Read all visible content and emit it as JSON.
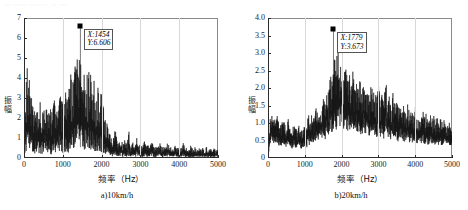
{
  "cutoff_text": "▫▫▫ ▫▫▫▫▫ ▫▫▫▫ ▫▫ ▫▫ ▫▫▫",
  "figures": [
    {
      "id": "figure-a",
      "caption": "a)10km/h",
      "ylabel": "振幅",
      "xlabel": "频率（Hz）",
      "datatip": {
        "x_label": "X:1454",
        "y_label": "Y:6.606"
      }
    },
    {
      "id": "figure-b",
      "caption": "b)20km/h",
      "ylabel": "振幅",
      "xlabel": "频率（Hz）",
      "datatip": {
        "x_label": "X:1779",
        "y_label": "Y:3.673"
      }
    }
  ],
  "chart_data": [
    {
      "type": "line",
      "title": "a)10km/h",
      "subtitle": "",
      "xlabel": "频率（Hz）",
      "ylabel": "振幅",
      "xlim": [
        0,
        5000
      ],
      "ylim": [
        0,
        7
      ],
      "xticks": [
        0,
        1000,
        2000,
        3000,
        4000,
        5000
      ],
      "yticks": [
        0,
        1,
        2,
        3,
        4,
        5,
        6,
        7
      ],
      "grid": false,
      "legend": null,
      "annotations": [
        {
          "type": "datatip",
          "x": 1454,
          "y": 6.606,
          "text": "X:1454 / Y:6.606",
          "marker": "square"
        }
      ],
      "series": [
        {
          "name": "振幅谱 10km/h",
          "comment": "envelope (upper peak hull) sampled every 50 Hz from 0 to 5000 Hz",
          "x": [
            0,
            50,
            100,
            150,
            200,
            250,
            300,
            350,
            400,
            450,
            500,
            550,
            600,
            650,
            700,
            750,
            800,
            850,
            900,
            950,
            1000,
            1050,
            1100,
            1150,
            1200,
            1250,
            1300,
            1350,
            1400,
            1450,
            1500,
            1550,
            1600,
            1650,
            1700,
            1750,
            1800,
            1850,
            1900,
            1950,
            2000,
            2050,
            2100,
            2150,
            2200,
            2250,
            2300,
            2350,
            2400,
            2450,
            2500,
            2550,
            2600,
            2650,
            2700,
            2750,
            2800,
            2850,
            2900,
            2950,
            3000,
            3050,
            3100,
            3150,
            3200,
            3250,
            3300,
            3350,
            3400,
            3450,
            3500,
            3550,
            3600,
            3650,
            3700,
            3750,
            3800,
            3850,
            3900,
            3950,
            4000,
            4050,
            4100,
            4150,
            4200,
            4250,
            4300,
            4350,
            4400,
            4450,
            4500,
            4550,
            4600,
            4650,
            4700,
            4750,
            4800,
            4850,
            4900,
            4950,
            5000
          ],
          "envelope": [
            0.3,
            3.6,
            5.05,
            4.2,
            2.95,
            2.7,
            2.55,
            2.4,
            3.1,
            2.3,
            2.65,
            3.35,
            2.5,
            2.8,
            2.35,
            2.6,
            3.05,
            2.45,
            3.7,
            2.9,
            3.25,
            2.85,
            4.15,
            3.3,
            4.6,
            3.95,
            4.4,
            5.1,
            4.85,
            6.61,
            5.2,
            4.7,
            4.95,
            4.3,
            4.55,
            3.85,
            4.1,
            3.4,
            3.7,
            3.05,
            3.35,
            2.55,
            2.2,
            1.65,
            1.35,
            1.05,
            0.95,
            1.55,
            0.85,
            0.75,
            1.2,
            0.7,
            0.95,
            0.65,
            1.45,
            0.6,
            0.8,
            0.55,
            1.1,
            0.6,
            0.75,
            0.5,
            0.95,
            0.55,
            0.7,
            0.5,
            1.3,
            0.55,
            0.65,
            0.48,
            0.8,
            0.5,
            0.62,
            0.45,
            0.9,
            0.5,
            0.6,
            0.45,
            0.72,
            0.48,
            0.58,
            0.42,
            0.85,
            0.46,
            0.56,
            0.4,
            0.68,
            0.44,
            0.55,
            0.4,
            0.62,
            0.42,
            0.52,
            0.38,
            0.58,
            0.4,
            0.5,
            0.38,
            0.55,
            0.4,
            0.48
          ],
          "noise_floor": [
            0.02,
            0.3,
            0.55,
            0.4,
            0.25,
            0.22,
            0.2,
            0.18,
            0.26,
            0.18,
            0.22,
            0.28,
            0.2,
            0.23,
            0.18,
            0.21,
            0.25,
            0.19,
            0.3,
            0.23,
            0.26,
            0.22,
            0.34,
            0.26,
            0.38,
            0.32,
            0.36,
            0.42,
            0.4,
            0.55,
            0.43,
            0.38,
            0.4,
            0.35,
            0.37,
            0.31,
            0.33,
            0.27,
            0.3,
            0.24,
            0.27,
            0.2,
            0.17,
            0.13,
            0.11,
            0.08,
            0.07,
            0.12,
            0.07,
            0.06,
            0.09,
            0.05,
            0.07,
            0.05,
            0.11,
            0.05,
            0.06,
            0.04,
            0.08,
            0.05,
            0.06,
            0.04,
            0.07,
            0.04,
            0.05,
            0.04,
            0.1,
            0.04,
            0.05,
            0.04,
            0.06,
            0.04,
            0.05,
            0.03,
            0.07,
            0.04,
            0.05,
            0.03,
            0.06,
            0.04,
            0.04,
            0.03,
            0.06,
            0.03,
            0.04,
            0.03,
            0.05,
            0.03,
            0.04,
            0.03,
            0.05,
            0.03,
            0.04,
            0.03,
            0.04,
            0.03,
            0.04,
            0.03,
            0.04,
            0.03,
            0.03
          ],
          "peak": {
            "x": 1454,
            "y": 6.606
          }
        }
      ]
    },
    {
      "type": "line",
      "title": "b)20km/h",
      "subtitle": "",
      "xlabel": "频率（Hz）",
      "ylabel": "振幅",
      "xlim": [
        0,
        5000
      ],
      "ylim": [
        0,
        4.0
      ],
      "xticks": [
        0,
        1000,
        2000,
        3000,
        4000,
        5000
      ],
      "yticks": [
        0,
        0.5,
        1.0,
        1.5,
        2.0,
        2.5,
        3.0,
        3.5,
        4.0
      ],
      "grid": false,
      "legend": null,
      "annotations": [
        {
          "type": "datatip",
          "x": 1779,
          "y": 3.673,
          "text": "X:1779 / Y:3.673",
          "marker": "square"
        }
      ],
      "series": [
        {
          "name": "振幅谱 20km/h",
          "comment": "envelope (upper peak hull) sampled every 50 Hz from 0 to 5000 Hz",
          "x": [
            0,
            50,
            100,
            150,
            200,
            250,
            300,
            350,
            400,
            450,
            500,
            550,
            600,
            650,
            700,
            750,
            800,
            850,
            900,
            950,
            1000,
            1050,
            1100,
            1150,
            1200,
            1250,
            1300,
            1350,
            1400,
            1450,
            1500,
            1550,
            1600,
            1650,
            1700,
            1750,
            1800,
            1850,
            1900,
            1950,
            2000,
            2050,
            2100,
            2150,
            2200,
            2250,
            2300,
            2350,
            2400,
            2450,
            2500,
            2550,
            2600,
            2650,
            2700,
            2750,
            2800,
            2850,
            2900,
            2950,
            3000,
            3050,
            3100,
            3150,
            3200,
            3250,
            3300,
            3350,
            3400,
            3450,
            3500,
            3550,
            3600,
            3650,
            3700,
            3750,
            3800,
            3850,
            3900,
            3950,
            4000,
            4050,
            4100,
            4150,
            4200,
            4250,
            4300,
            4350,
            4400,
            4450,
            4500,
            4550,
            4600,
            4650,
            4700,
            4750,
            4800,
            4850,
            4900,
            4950,
            5000
          ],
          "envelope": [
            0.2,
            1.15,
            1.4,
            1.25,
            1.05,
            1.3,
            1.1,
            0.95,
            1.2,
            1.0,
            0.88,
            1.12,
            0.95,
            0.82,
            1.05,
            0.9,
            0.78,
            1.0,
            0.85,
            0.95,
            1.1,
            0.92,
            1.25,
            1.05,
            1.35,
            1.15,
            1.55,
            1.3,
            1.7,
            1.45,
            1.95,
            1.6,
            2.25,
            1.85,
            2.55,
            2.1,
            3.0,
            2.4,
            3.67,
            2.8,
            3.1,
            2.45,
            2.85,
            2.3,
            2.6,
            2.15,
            2.7,
            2.25,
            2.4,
            2.05,
            2.3,
            1.95,
            2.5,
            2.1,
            2.2,
            1.85,
            2.35,
            1.95,
            2.05,
            1.7,
            2.15,
            1.8,
            1.9,
            1.6,
            2.45,
            1.7,
            1.8,
            1.5,
            1.95,
            1.55,
            1.65,
            1.4,
            1.75,
            1.45,
            1.55,
            1.3,
            1.6,
            1.35,
            1.45,
            1.25,
            1.5,
            1.28,
            1.38,
            1.18,
            1.42,
            1.2,
            1.3,
            1.1,
            1.35,
            1.12,
            1.22,
            1.05,
            1.28,
            1.08,
            1.15,
            1.0,
            1.2,
            1.02,
            1.1,
            0.95,
            1.05
          ],
          "noise_floor": [
            0.02,
            0.35,
            0.45,
            0.4,
            0.33,
            0.42,
            0.35,
            0.3,
            0.38,
            0.32,
            0.28,
            0.36,
            0.3,
            0.26,
            0.34,
            0.29,
            0.25,
            0.32,
            0.27,
            0.3,
            0.35,
            0.29,
            0.4,
            0.33,
            0.43,
            0.37,
            0.5,
            0.42,
            0.54,
            0.46,
            0.62,
            0.51,
            0.72,
            0.59,
            0.81,
            0.67,
            0.95,
            0.76,
            1.05,
            0.89,
            0.99,
            0.78,
            0.91,
            0.73,
            0.83,
            0.68,
            0.86,
            0.72,
            0.77,
            0.65,
            0.73,
            0.62,
            0.8,
            0.67,
            0.7,
            0.59,
            0.75,
            0.62,
            0.65,
            0.54,
            0.69,
            0.57,
            0.61,
            0.51,
            0.78,
            0.54,
            0.57,
            0.48,
            0.62,
            0.49,
            0.53,
            0.45,
            0.56,
            0.46,
            0.49,
            0.41,
            0.51,
            0.43,
            0.46,
            0.4,
            0.48,
            0.41,
            0.44,
            0.38,
            0.45,
            0.38,
            0.42,
            0.35,
            0.43,
            0.36,
            0.39,
            0.33,
            0.41,
            0.35,
            0.37,
            0.32,
            0.38,
            0.33,
            0.35,
            0.3,
            0.34
          ],
          "peak": {
            "x": 1779,
            "y": 3.673
          }
        }
      ]
    }
  ]
}
